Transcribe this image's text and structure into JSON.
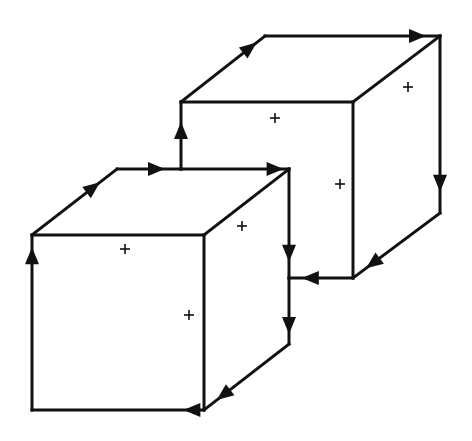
{
  "diagram": {
    "type": "two-cube-circulation",
    "stroke_color": "#111111",
    "background": "#ffffff",
    "edges": [
      {
        "id": "front-cube-front-top",
        "from": [
          32,
          235
        ],
        "to": [
          204,
          235
        ],
        "arrow": false
      },
      {
        "id": "front-cube-front-right",
        "from": [
          204,
          235
        ],
        "to": [
          204,
          410
        ],
        "arrow": false
      },
      {
        "id": "front-cube-front-bottom",
        "from": [
          204,
          410
        ],
        "to": [
          32,
          410
        ],
        "arrow": true,
        "arrow_at": 0.12
      },
      {
        "id": "front-cube-front-left",
        "from": [
          32,
          410
        ],
        "to": [
          32,
          235
        ],
        "arrow": true,
        "arrow_at": 0.93
      },
      {
        "id": "front-cube-left-diag",
        "from": [
          32,
          235
        ],
        "to": [
          117,
          169
        ],
        "arrow": true,
        "arrow_at": 0.8
      },
      {
        "id": "front-cube-top-back-a",
        "from": [
          117,
          169
        ],
        "to": [
          181,
          169
        ],
        "arrow": true,
        "arrow_at": 0.75
      },
      {
        "id": "front-cube-top-back-b",
        "from": [
          181,
          169
        ],
        "to": [
          289,
          169
        ],
        "arrow": true,
        "arrow_at": 0.95
      },
      {
        "id": "front-cube-right-diag",
        "from": [
          204,
          235
        ],
        "to": [
          289,
          169
        ],
        "arrow": false
      },
      {
        "id": "front-cube-back-right-a",
        "from": [
          289,
          169
        ],
        "to": [
          289,
          278
        ],
        "arrow": true,
        "arrow_at": 0.85
      },
      {
        "id": "front-cube-back-right-b",
        "from": [
          289,
          278
        ],
        "to": [
          289,
          344
        ],
        "arrow": true,
        "arrow_at": 0.85
      },
      {
        "id": "front-cube-bottom-diag",
        "from": [
          289,
          344
        ],
        "to": [
          204,
          410
        ],
        "arrow": true,
        "arrow_at": 0.85
      },
      {
        "id": "back-cube-front-left",
        "from": [
          181,
          169
        ],
        "to": [
          181,
          102
        ],
        "arrow": true,
        "arrow_at": 0.7
      },
      {
        "id": "back-cube-front-top",
        "from": [
          181,
          102
        ],
        "to": [
          353,
          102
        ],
        "arrow": false
      },
      {
        "id": "back-cube-front-right",
        "from": [
          353,
          102
        ],
        "to": [
          353,
          278
        ],
        "arrow": false
      },
      {
        "id": "back-cube-front-bottom",
        "from": [
          353,
          278
        ],
        "to": [
          289,
          278
        ],
        "arrow": true,
        "arrow_at": 0.8
      },
      {
        "id": "back-cube-left-diag",
        "from": [
          181,
          102
        ],
        "to": [
          265,
          36
        ],
        "arrow": true,
        "arrow_at": 0.9
      },
      {
        "id": "back-cube-top-back",
        "from": [
          265,
          36
        ],
        "to": [
          440,
          36
        ],
        "arrow": true,
        "arrow_at": 0.92
      },
      {
        "id": "back-cube-right-diag",
        "from": [
          353,
          102
        ],
        "to": [
          440,
          36
        ],
        "arrow": false
      },
      {
        "id": "back-cube-back-right",
        "from": [
          440,
          36
        ],
        "to": [
          440,
          213
        ],
        "arrow": true,
        "arrow_at": 0.88
      },
      {
        "id": "back-cube-bottom-diag",
        "from": [
          440,
          213
        ],
        "to": [
          353,
          278
        ],
        "arrow": true,
        "arrow_at": 0.85
      }
    ],
    "markers": [
      {
        "id": "plus-front-cube-front-face",
        "label": "+",
        "x": 125,
        "y": 249
      },
      {
        "id": "plus-front-cube-right-face",
        "label": "+",
        "x": 189,
        "y": 315
      },
      {
        "id": "plus-front-cube-top-face",
        "label": "+",
        "x": 242,
        "y": 226
      },
      {
        "id": "plus-back-cube-front-face",
        "label": "+",
        "x": 275,
        "y": 118
      },
      {
        "id": "plus-back-cube-right-face",
        "label": "+",
        "x": 408,
        "y": 87
      },
      {
        "id": "plus-back-cube-side-face",
        "label": "+",
        "x": 340,
        "y": 184
      }
    ]
  }
}
